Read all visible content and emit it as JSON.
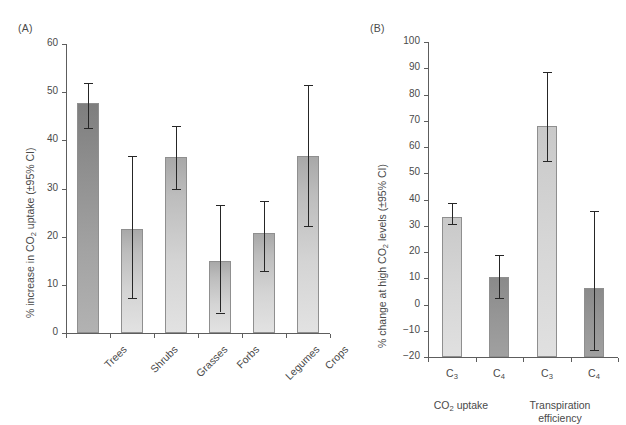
{
  "figure": {
    "background": "#ffffff",
    "bar_light_color": "#d4d4d4",
    "bar_dark_color": "#9a9a9a",
    "error_bar_color": "#262626",
    "axis_color": "#5d5d5d",
    "text_color": "#4a4a4a"
  },
  "panelA": {
    "tag": "(A)",
    "ylabel_prefix": "% increase in CO",
    "ylabel_sub": "2",
    "ylabel_suffix": " uptake (±95% CI)"
  },
  "panelB": {
    "tag": "(B)",
    "ylabel_prefix": "% change at high CO",
    "ylabel_sub": "2",
    "ylabel_suffix": " levels (±95% CI)",
    "group1_prefix": "CO",
    "group1_sub": "2",
    "group1_suffix": " uptake",
    "group2_line1": "Transpiration",
    "group2_line2": "efficiency",
    "c3_prefix": "C",
    "c3_sub": "3",
    "c4_prefix": "C",
    "c4_sub": "4"
  },
  "chart_data": [
    {
      "type": "bar",
      "panel": "(A)",
      "title": "",
      "xlabel": "",
      "ylabel": "% increase in CO2 uptake (±95% CI)",
      "ylim": [
        0,
        60
      ],
      "yticks": [
        0,
        10,
        20,
        30,
        40,
        50,
        60
      ],
      "grid": false,
      "legend": "none",
      "categories": [
        "Trees",
        "Shrubs",
        "Grasses",
        "Forbs",
        "Legumes",
        "Crops"
      ],
      "values": [
        47.8,
        21.5,
        36.5,
        15.0,
        20.8,
        36.8
      ],
      "ci_low": [
        42.5,
        7.3,
        30.0,
        4.2,
        12.8,
        22.2
      ],
      "ci_high": [
        52.0,
        36.8,
        43.0,
        26.5,
        27.5,
        51.5
      ],
      "bar_styles": [
        "dark",
        "light",
        "light",
        "light",
        "light",
        "light"
      ]
    },
    {
      "type": "bar",
      "panel": "(B)",
      "title": "",
      "xlabel": "",
      "ylabel": "% change at high CO2 levels (±95% CI)",
      "ylim": [
        -20,
        100
      ],
      "yticks": [
        -20,
        -10,
        0,
        10,
        20,
        30,
        40,
        50,
        60,
        70,
        80,
        90,
        100
      ],
      "grid": false,
      "legend": "none",
      "groups": [
        "CO2 uptake",
        "Transpiration efficiency"
      ],
      "categories": [
        "C3",
        "C4",
        "C3",
        "C4"
      ],
      "values": [
        33.5,
        10.5,
        68.0,
        6.3
      ],
      "ci_low": [
        30.5,
        2.3,
        54.5,
        -17.5
      ],
      "ci_high": [
        38.5,
        19.0,
        88.5,
        35.5
      ],
      "bar_styles": [
        "flat-light",
        "flat-dark",
        "flat-light",
        "flat-dark"
      ]
    }
  ],
  "ticksA": [
    "60",
    "50",
    "40",
    "30",
    "20",
    "10",
    "0"
  ],
  "ticksB": [
    "100",
    "90",
    "80",
    "70",
    "60",
    "50",
    "40",
    "30",
    "20",
    "10",
    "0",
    "−10",
    "−20"
  ]
}
